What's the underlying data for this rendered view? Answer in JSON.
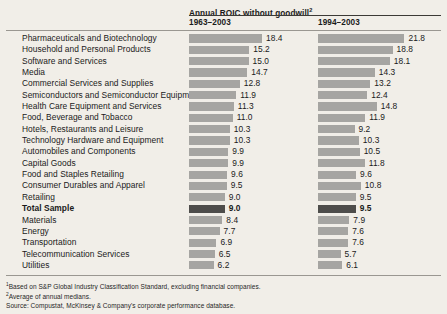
{
  "exhibit": {
    "header": {
      "metric_title": "Annual ROIC without goodwill",
      "metric_title_superscript": "2",
      "column_headers": [
        "1963–2003",
        "1994–2003"
      ]
    },
    "footnotes": [
      {
        "marker": "1",
        "text": "Based on S&P Global Industry Classification Standard, excluding financial companies."
      },
      {
        "marker": "2",
        "text": "Average of annual medians."
      }
    ],
    "source": "Source: Compustat, McKinsey & Company's corporate performance database.",
    "colors": {
      "background": "#f1eee8",
      "bar": "#a6a5a2",
      "bar_highlight": "#4e4d4b",
      "rule": "#3c3a36",
      "text": "#1a1a1a"
    }
  },
  "chart_data": {
    "type": "bar",
    "orientation": "horizontal",
    "title": "Annual ROIC without goodwill",
    "xlabel": "",
    "ylabel": "",
    "grid": false,
    "legend": "none",
    "xlim": [
      0,
      22
    ],
    "categories": [
      "Pharmaceuticals and Biotechnology",
      "Household and Personal Products",
      "Software and Services",
      "Media",
      "Commercial Services and Supplies",
      "Semiconductors and Semiconductor Equipment",
      "Health Care Equipment and Services",
      "Food, Beverage and Tobacco",
      "Hotels, Restaurants and Leisure",
      "Technology Hardware and Equipment",
      "Automobiles and Components",
      "Capital Goods",
      "Food and Staples Retailing",
      "Consumer Durables and Apparel",
      "Retailing",
      "Total Sample",
      "Materials",
      "Energy",
      "Transportation",
      "Telecommunication Services",
      "Utilities"
    ],
    "highlight_categories": [
      "Total Sample"
    ],
    "series": [
      {
        "name": "1963–2003",
        "values": [
          18.4,
          15.2,
          15.0,
          14.7,
          12.8,
          11.9,
          11.3,
          11.0,
          10.3,
          10.3,
          9.9,
          9.9,
          9.6,
          9.5,
          9.0,
          9.0,
          8.4,
          7.7,
          6.9,
          6.5,
          6.2
        ]
      },
      {
        "name": "1994–2003",
        "values": [
          21.8,
          18.8,
          18.1,
          14.3,
          13.2,
          12.4,
          14.8,
          11.9,
          9.2,
          10.3,
          10.5,
          11.8,
          9.6,
          10.8,
          9.5,
          9.5,
          7.9,
          7.6,
          7.6,
          5.7,
          6.1
        ]
      }
    ]
  }
}
